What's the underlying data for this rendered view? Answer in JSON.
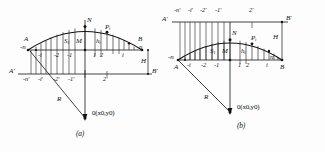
{
  "document": {
    "type": "technical-line-drawing",
    "subject": "parabolic arch with ordinate stations, radius R and origin O",
    "ink_color": "#141414",
    "background_color": "#fdfdfd"
  },
  "figures": [
    {
      "id": "a",
      "caption": "(a)",
      "apex_label": "N",
      "point_label": "P",
      "point_sub": "i",
      "area_label": "S",
      "area_sub": "1",
      "mid_label": "M",
      "height_label": "h",
      "height_sub": "i",
      "radius_label": "R",
      "origin_label": "0(x0,y0)",
      "rise_label": "H",
      "left_top": "A",
      "right_top": "B",
      "left_base": "A'",
      "right_base": "B'",
      "left_end": "-n",
      "right_end": "n",
      "upper_ticks": [
        "-i",
        "-2",
        "-1",
        "1",
        "2",
        "i"
      ],
      "lower_ticks": [
        "-n'",
        "-i'",
        "-2'",
        "-1'",
        "2'"
      ]
    },
    {
      "id": "b",
      "caption": "(b)",
      "apex_label": "N",
      "point_label": "P",
      "point_sub": "i",
      "area_label": "S",
      "area_sub": "1",
      "mid_label": "M",
      "height_label": "h",
      "height_sub": "i",
      "radius_label": "R",
      "origin_label": "0(x0,y0)",
      "rise_label": "H",
      "left_top": "A'",
      "right_top": "B'",
      "left_base": "A",
      "right_base": "B",
      "left_end": "-n",
      "right_end": "n",
      "upper_ticks": [
        "-n'",
        "-i'",
        "-2'",
        "-1'",
        "2'"
      ],
      "lower_ticks": [
        "-i",
        "-2",
        "-1",
        "1",
        "2",
        "i"
      ]
    }
  ]
}
